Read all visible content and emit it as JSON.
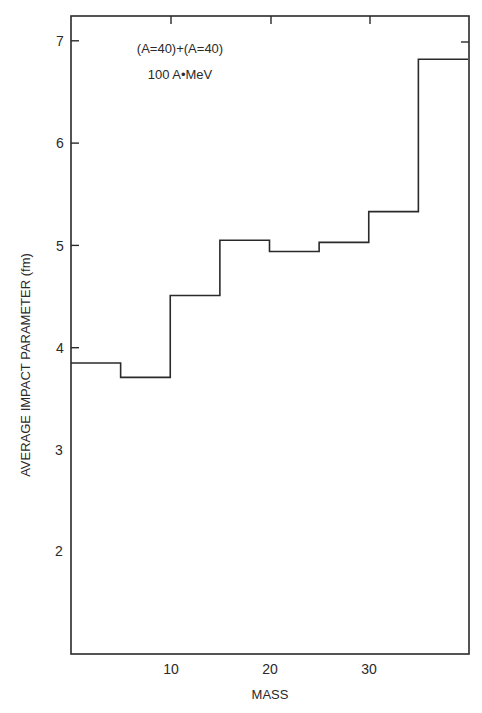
{
  "chart_data": {
    "type": "bar",
    "style": "histogram-step",
    "title": "",
    "annotation": [
      "(A=40)+(A=40)",
      "100 A•MeV"
    ],
    "xlabel": "MASS",
    "ylabel": "AVERAGE IMPACT PARAMETER (fm)",
    "xlim": [
      0,
      40
    ],
    "ylim": [
      1.0,
      7.25
    ],
    "x_ticks": [
      10,
      20,
      30
    ],
    "x_tick_labels": [
      "10",
      "20",
      "30"
    ],
    "y_ticks": [
      2,
      3,
      4,
      5,
      6,
      7
    ],
    "y_tick_labels": [
      "2",
      "3",
      "4",
      "5",
      "6",
      "7"
    ],
    "grid": false,
    "legend": null,
    "bin_edges": [
      0,
      5,
      10,
      15,
      20,
      25,
      30,
      35,
      40
    ],
    "categories": [
      "0-5",
      "5-10",
      "10-15",
      "15-20",
      "20-25",
      "25-30",
      "30-35",
      "35-40"
    ],
    "values": [
      3.85,
      3.71,
      4.51,
      5.05,
      4.94,
      5.03,
      5.33,
      6.82
    ]
  },
  "colors": {
    "line": "#2a2a2a",
    "background": "#ffffff"
  }
}
